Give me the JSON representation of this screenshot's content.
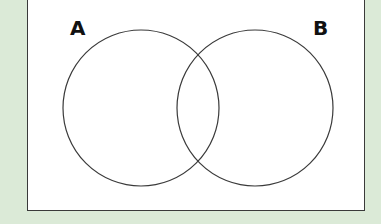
{
  "diagram": {
    "type": "venn",
    "sets": [
      {
        "label": "A",
        "cx": 141,
        "cy": 108,
        "r": 78
      },
      {
        "label": "B",
        "cx": 255,
        "cy": 108,
        "r": 78
      }
    ],
    "colors": {
      "background": "#dbead7",
      "panel": "#ffffff",
      "stroke": "#3a3a3a",
      "text": "#111111"
    }
  }
}
